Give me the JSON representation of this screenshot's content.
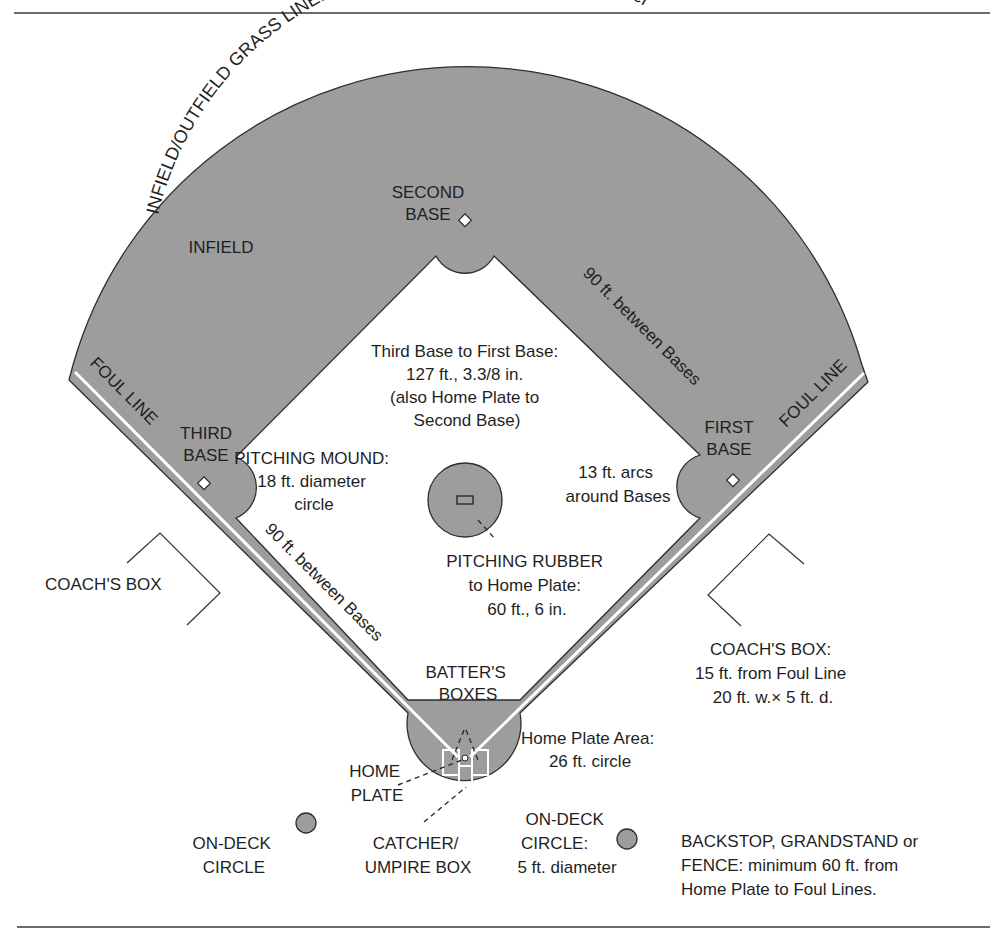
{
  "figure": {
    "top_rule": {
      "y": 13,
      "x1": 14,
      "x2": 990
    },
    "bottom_rule": {
      "y": 927,
      "x1": 17,
      "x2": 990
    },
    "colors": {
      "field_fill": "#9d9d9d",
      "outline": "#2e2e2e",
      "foul_stripe": "#ffffff",
      "text": "#1f1f1f"
    }
  },
  "labels": {
    "grass_line": "INFIELD/OUTFIELD GRASS LINE: 95 ft. radius from front of Pitching Rubber",
    "second_base": [
      "SECOND",
      "BASE"
    ],
    "infield": "INFIELD",
    "between_bases_right": "90 ft. between Bases",
    "between_bases_left": "90 ft. between Bases",
    "third_to_first": [
      "Third Base to First Base:",
      "127 ft., 3.3/8 in.",
      "(also Home Plate to",
      "Second Base)"
    ],
    "foul_line_left": "FOUL LINE",
    "foul_line_right": "FOUL LINE",
    "third_base": [
      "THIRD",
      "BASE"
    ],
    "first_base": [
      "FIRST",
      "BASE"
    ],
    "pitching_mound": [
      "PITCHING MOUND:",
      "18 ft. diameter",
      "circle"
    ],
    "arcs_around_bases": [
      "13 ft. arcs",
      "around Bases"
    ],
    "pitching_rubber": [
      "PITCHING RUBBER",
      "to Home Plate:",
      "60 ft., 6 in."
    ],
    "coach_box_left": "COACH'S BOX",
    "coach_box_right": [
      "COACH'S BOX:",
      "15 ft. from Foul Line",
      "20 ft. w.× 5 ft. d."
    ],
    "batters_boxes": [
      "BATTER'S",
      "BOXES"
    ],
    "home_plate_area": [
      "Home Plate Area:",
      "26 ft. circle"
    ],
    "home_plate": [
      "HOME",
      "PLATE"
    ],
    "on_deck_left": [
      "ON-DECK",
      "CIRCLE"
    ],
    "catcher_box": [
      "CATCHER/",
      "UMPIRE BOX"
    ],
    "on_deck_right": [
      "ON-DECK",
      "CIRCLE:",
      "5 ft. diameter"
    ],
    "backstop": [
      "BACKSTOP, GRANDSTAND or",
      "FENCE: minimum 60 ft. from",
      "Home Plate to Foul Lines."
    ]
  },
  "icons": {
    "base_marker": "diamond-outline",
    "on_deck_circle": "filled-circle",
    "pitching_rubber": "rectangle-outline"
  }
}
